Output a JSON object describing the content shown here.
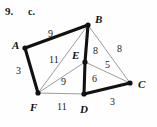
{
  "figure": {
    "problem_number": "9.",
    "part_letter": "c.",
    "width": 157,
    "height": 127,
    "background_color": "#fefefe",
    "ink_color": "#111111",
    "thin_edge_color": "#8a8a8a"
  },
  "vertices": [
    {
      "name": "A",
      "label": "A",
      "x": 25,
      "y": 48,
      "label_x": 12,
      "label_y": 40
    },
    {
      "name": "B",
      "label": "B",
      "x": 88,
      "y": 25,
      "label_x": 95,
      "label_y": 14
    },
    {
      "name": "C",
      "label": "C",
      "x": 130,
      "y": 83,
      "label_x": 138,
      "label_y": 79
    },
    {
      "name": "D",
      "label": "D",
      "x": 84,
      "y": 94,
      "label_x": 80,
      "label_y": 104
    },
    {
      "name": "E",
      "label": "E",
      "x": 85,
      "y": 62,
      "label_x": 72,
      "label_y": 50
    },
    {
      "name": "F",
      "label": "F",
      "x": 38,
      "y": 93,
      "label_x": 30,
      "label_y": 102
    }
  ],
  "edges": [
    {
      "name": "edge-A-B",
      "from": "A",
      "to": "B",
      "weight": "9",
      "style": "thick",
      "label_x": 48,
      "label_y": 29
    },
    {
      "name": "edge-A-F",
      "from": "A",
      "to": "F",
      "weight": "3",
      "style": "thick",
      "label_x": 16,
      "label_y": 66
    },
    {
      "name": "edge-B-E",
      "from": "B",
      "to": "E",
      "weight": "8",
      "style": "thick",
      "label_x": 93,
      "label_y": 46
    },
    {
      "name": "edge-E-D",
      "from": "E",
      "to": "D",
      "weight": "6",
      "style": "thick",
      "label_x": 92,
      "label_y": 74
    },
    {
      "name": "edge-D-C",
      "from": "D",
      "to": "C",
      "weight": "3",
      "style": "thick",
      "label_x": 110,
      "label_y": 97
    },
    {
      "name": "edge-B-C",
      "from": "B",
      "to": "C",
      "weight": "8",
      "style": "thin",
      "label_x": 117,
      "label_y": 44
    },
    {
      "name": "edge-E-C",
      "from": "E",
      "to": "C",
      "weight": "5",
      "style": "thin",
      "label_x": 105,
      "label_y": 60
    },
    {
      "name": "edge-B-F",
      "from": "B",
      "to": "F",
      "weight": "11",
      "style": "thin",
      "label_x": 49,
      "label_y": 55
    },
    {
      "name": "edge-F-E",
      "from": "F",
      "to": "E",
      "weight": "9",
      "style": "thin",
      "label_x": 61,
      "label_y": 77
    },
    {
      "name": "edge-F-D",
      "from": "F",
      "to": "D",
      "weight": "11",
      "style": "thin",
      "label_x": 57,
      "label_y": 102
    }
  ],
  "chart_data": {
    "type": "diagram",
    "nodes": [
      "A",
      "B",
      "C",
      "D",
      "E",
      "F"
    ],
    "edges": [
      {
        "u": "A",
        "v": "B",
        "weight": 9
      },
      {
        "u": "A",
        "v": "F",
        "weight": 3
      },
      {
        "u": "B",
        "v": "E",
        "weight": 8
      },
      {
        "u": "B",
        "v": "C",
        "weight": 8
      },
      {
        "u": "B",
        "v": "F",
        "weight": 11
      },
      {
        "u": "E",
        "v": "C",
        "weight": 5
      },
      {
        "u": "E",
        "v": "D",
        "weight": 6
      },
      {
        "u": "E",
        "v": "F",
        "weight": 9
      },
      {
        "u": "D",
        "v": "C",
        "weight": 3
      },
      {
        "u": "D",
        "v": "F",
        "weight": 11
      }
    ],
    "highlighted_edges": [
      "A-B",
      "A-F",
      "B-E",
      "E-D",
      "D-C"
    ],
    "highlighted_total_weight": 29
  }
}
